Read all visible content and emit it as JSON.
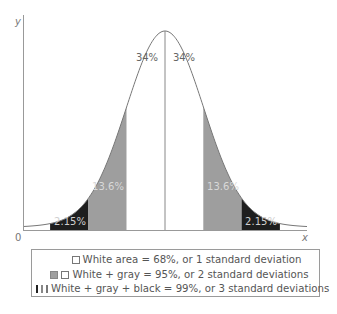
{
  "chart_data": {
    "type": "area",
    "title": "",
    "xlabel": "x",
    "ylabel": "y",
    "origin_label": "0",
    "bands": [
      {
        "sigma_from": -3,
        "sigma_to": -2,
        "fill": "black",
        "label": "2.15%",
        "value": 2.15
      },
      {
        "sigma_from": -2,
        "sigma_to": -1,
        "fill": "gray",
        "label": "13.6%",
        "value": 13.6
      },
      {
        "sigma_from": -1,
        "sigma_to": 0,
        "fill": "white",
        "label": "34%",
        "value": 34
      },
      {
        "sigma_from": 0,
        "sigma_to": 1,
        "fill": "white",
        "label": "34%",
        "value": 34
      },
      {
        "sigma_from": 1,
        "sigma_to": 2,
        "fill": "gray",
        "label": "13.6%",
        "value": 13.6
      },
      {
        "sigma_from": 2,
        "sigma_to": 3,
        "fill": "black",
        "label": "2.15%",
        "value": 2.15
      }
    ],
    "colors": {
      "black": "#1e1e1e",
      "gray": "#9e9e9e",
      "white": "#ffffff",
      "line": "#777777"
    },
    "grid": false
  },
  "axes": {
    "x_label": "x",
    "y_label": "y",
    "origin": "0"
  },
  "labels": {
    "band_left_3": "2.15%",
    "band_left_2": "13.6%",
    "band_left_1": "34%",
    "band_right_1": "34%",
    "band_right_2": "13.6%",
    "band_right_3": "2.15%"
  },
  "legend": {
    "items": [
      {
        "text": "White area = 68%, or 1 standard deviation",
        "swatches": [
          "white"
        ]
      },
      {
        "text": "White + gray = 95%, or 2 standard deviations",
        "swatches": [
          "gray",
          "white"
        ]
      },
      {
        "text": "White + gray + black = 99%, or 3 standard deviations",
        "swatches": [
          "black",
          "gray",
          "white"
        ]
      }
    ]
  }
}
